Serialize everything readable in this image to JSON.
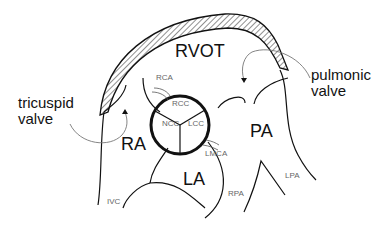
{
  "diagram": {
    "type": "anatomical schematic",
    "regions": [
      {
        "id": "rvot",
        "label": "RVOT"
      },
      {
        "id": "ra",
        "label": "RA"
      },
      {
        "id": "la",
        "label": "LA"
      },
      {
        "id": "pa",
        "label": "PA"
      }
    ],
    "cusps": [
      {
        "id": "rcc",
        "label": "RCC"
      },
      {
        "id": "ncc",
        "label": "NCC"
      },
      {
        "id": "lcc",
        "label": "LCC"
      }
    ],
    "vessels": [
      {
        "id": "rca",
        "label": "RCA"
      },
      {
        "id": "lmca",
        "label": "LMCA"
      },
      {
        "id": "ivc",
        "label": "IVC"
      },
      {
        "id": "rpa",
        "label": "RPA"
      },
      {
        "id": "lpa",
        "label": "LPA"
      }
    ],
    "callouts": [
      {
        "id": "tricuspid",
        "line1": "tricuspid",
        "line2": "valve"
      },
      {
        "id": "pulmonic",
        "line1": "pulmonic",
        "line2": "valve"
      }
    ],
    "colors": {
      "stroke": "#111111",
      "leader": "#777777",
      "background": "#ffffff"
    }
  }
}
